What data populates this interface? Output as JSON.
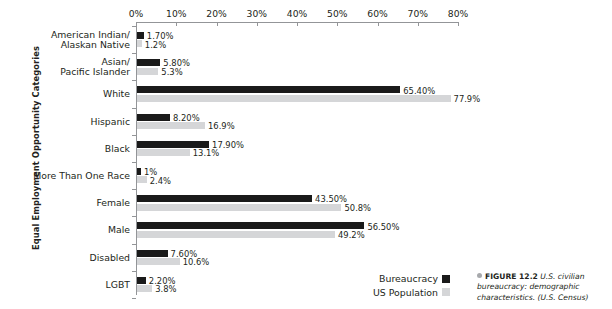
{
  "figure": {
    "y_axis_title": "Equal Employment Opportunity Categories",
    "caption_bullet": "bullet-icon",
    "caption_figure_number": "FIGURE 12.2",
    "caption_text": "U.S. civilian bureaucracy: demographic characteristics. (U.S. Census)"
  },
  "legend": {
    "items": [
      {
        "label": "Bureaucracy",
        "color": "#1a1a1a",
        "key": "bureaucracy"
      },
      {
        "label": "US Population",
        "color": "#d5d6d8",
        "key": "uspopulation"
      }
    ]
  },
  "chart_data": {
    "type": "bar",
    "orientation": "horizontal",
    "title": "",
    "xlabel": "",
    "ylabel": "Equal Employment Opportunity Categories",
    "xlim": [
      0,
      80
    ],
    "xtick_labels": [
      "0%",
      "10%",
      "20%",
      "30%",
      "40%",
      "50%",
      "60%",
      "70%",
      "80%"
    ],
    "xticks": [
      0,
      10,
      20,
      30,
      40,
      50,
      60,
      70,
      80
    ],
    "grid": false,
    "legend_position": "bottom-right",
    "categories": [
      "American Indian/\nAlaskan Native",
      "Asian/\nPacific Islander",
      "White",
      "Hispanic",
      "Black",
      "More Than One Race",
      "Female",
      "Male",
      "Disabled",
      "LGBT"
    ],
    "series": [
      {
        "name": "Bureaucracy",
        "color": "#1a1a1a",
        "values": [
          1.7,
          5.8,
          65.4,
          8.2,
          17.9,
          1.0,
          43.5,
          56.5,
          7.6,
          2.2
        ],
        "labels": [
          "1.70%",
          "5.80%",
          "65.40%",
          "8.20%",
          "17.90%",
          "1%",
          "43.50%",
          "56.50%",
          "7.60%",
          "2.20%"
        ]
      },
      {
        "name": "US Population",
        "color": "#d5d6d8",
        "values": [
          1.2,
          5.3,
          77.9,
          16.9,
          13.1,
          2.4,
          50.8,
          49.2,
          10.6,
          3.8
        ],
        "labels": [
          "1.2%",
          "5.3%",
          "77.9%",
          "16.9%",
          "13.1%",
          "2.4%",
          "50.8%",
          "49.2%",
          "10.6%",
          "3.8%"
        ]
      }
    ]
  }
}
